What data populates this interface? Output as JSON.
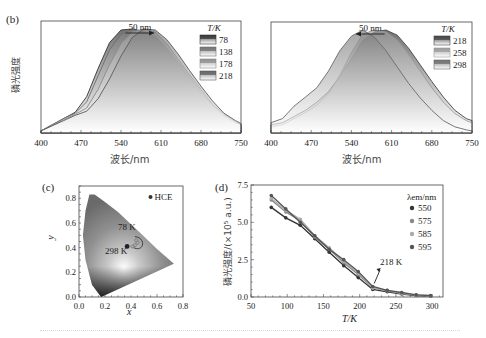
{
  "chart_data": [
    {
      "panel": "(b-left)",
      "type": "area",
      "title": "",
      "xlabel": "波长/nm",
      "ylabel": "磷光强度",
      "xlim": [
        400,
        750
      ],
      "xticks": [
        400,
        470,
        540,
        610,
        680,
        750
      ],
      "legend_title": "T/K",
      "legend_position": "upper right",
      "annotation": "50 nm",
      "annotation_direction": "right",
      "x": [
        400,
        420,
        440,
        460,
        480,
        500,
        520,
        540,
        560,
        580,
        600,
        620,
        640,
        660,
        680,
        700,
        720,
        740,
        750
      ],
      "series": [
        {
          "name": "78",
          "color": "#333333",
          "values": [
            0.02,
            0.08,
            0.14,
            0.2,
            0.35,
            0.62,
            0.87,
            0.99,
            1.0,
            0.97,
            0.92,
            0.8,
            0.66,
            0.52,
            0.38,
            0.26,
            0.16,
            0.1,
            0.08
          ]
        },
        {
          "name": "138",
          "color": "#6e6e6e",
          "values": [
            0.02,
            0.08,
            0.14,
            0.19,
            0.3,
            0.55,
            0.8,
            0.95,
            1.0,
            0.98,
            0.93,
            0.82,
            0.68,
            0.54,
            0.4,
            0.27,
            0.17,
            0.1,
            0.08
          ]
        },
        {
          "name": "178",
          "color": "#8a8a8a",
          "values": [
            0.02,
            0.07,
            0.13,
            0.18,
            0.24,
            0.42,
            0.66,
            0.86,
            0.97,
            1.0,
            0.97,
            0.86,
            0.71,
            0.56,
            0.42,
            0.28,
            0.18,
            0.11,
            0.08
          ]
        },
        {
          "name": "218",
          "color": "#5a5a5a",
          "values": [
            0.02,
            0.07,
            0.12,
            0.17,
            0.21,
            0.33,
            0.52,
            0.74,
            0.92,
            1.0,
            0.99,
            0.9,
            0.76,
            0.6,
            0.45,
            0.31,
            0.19,
            0.12,
            0.09
          ]
        }
      ]
    },
    {
      "panel": "(b-right)",
      "type": "area",
      "title": "",
      "xlabel": "波长/nm",
      "ylabel": "",
      "xlim": [
        400,
        750
      ],
      "xticks": [
        400,
        470,
        540,
        610,
        680,
        750
      ],
      "legend_title": "T/K",
      "legend_position": "upper right",
      "annotation": "50 nm",
      "annotation_direction": "left",
      "x": [
        400,
        420,
        440,
        460,
        480,
        500,
        520,
        540,
        560,
        580,
        600,
        620,
        640,
        660,
        680,
        700,
        720,
        740,
        750
      ],
      "series": [
        {
          "name": "218",
          "color": "#444444",
          "values": [
            0.08,
            0.1,
            0.16,
            0.22,
            0.3,
            0.4,
            0.55,
            0.72,
            0.9,
            0.98,
            1.0,
            0.95,
            0.82,
            0.66,
            0.5,
            0.35,
            0.22,
            0.14,
            0.12
          ]
        },
        {
          "name": "258",
          "color": "#9a9a9a",
          "values": [
            0.06,
            0.08,
            0.14,
            0.2,
            0.27,
            0.38,
            0.56,
            0.78,
            0.96,
            1.0,
            0.98,
            0.9,
            0.76,
            0.6,
            0.44,
            0.3,
            0.19,
            0.12,
            0.1
          ]
        },
        {
          "name": "298",
          "color": "#6a6a6a",
          "values": [
            0.1,
            0.14,
            0.26,
            0.35,
            0.44,
            0.6,
            0.8,
            0.94,
            1.0,
            0.93,
            0.8,
            0.64,
            0.48,
            0.34,
            0.22,
            0.12,
            0.06,
            0.03,
            0.02
          ]
        }
      ]
    },
    {
      "panel": "(c)",
      "type": "scatter",
      "title": "CIE chromaticity diagram",
      "xlabel": "x",
      "ylabel": "y",
      "xlim": [
        0.0,
        0.8
      ],
      "ylim": [
        0.0,
        0.9
      ],
      "xticks": [
        0.0,
        0.2,
        0.4,
        0.6,
        0.8
      ],
      "yticks": [
        0.0,
        0.2,
        0.4,
        0.6,
        0.8
      ],
      "legend": [
        "HCE"
      ],
      "annotations": [
        "78 K",
        "298 K"
      ],
      "points": [
        {
          "label": "78 K",
          "x": 0.46,
          "y": 0.5
        },
        {
          "label": "298 K",
          "x": 0.37,
          "y": 0.41
        }
      ]
    },
    {
      "panel": "(d)",
      "type": "line",
      "title": "",
      "xlabel": "T/K",
      "ylabel": "磷光强度/(×10⁵ a.u.)",
      "xlim": [
        50,
        315
      ],
      "ylim": [
        0.0,
        7.5
      ],
      "xticks": [
        50,
        100,
        150,
        200,
        250,
        300
      ],
      "yticks": [
        0.0,
        2.5,
        5.0,
        7.5
      ],
      "legend_title": "λem/nm",
      "legend_position": "upper right",
      "annotation": "218 K",
      "x": [
        78,
        98,
        118,
        138,
        158,
        178,
        198,
        218,
        238,
        258,
        278,
        298
      ],
      "series": [
        {
          "name": "550",
          "color": "#333333",
          "values": [
            6.0,
            5.3,
            4.8,
            3.9,
            3.0,
            2.1,
            1.3,
            0.5,
            0.35,
            0.2,
            0.1,
            0.05
          ]
        },
        {
          "name": "575",
          "color": "#888888",
          "values": [
            6.5,
            5.7,
            5.1,
            4.0,
            3.2,
            2.3,
            1.5,
            0.6,
            0.4,
            0.25,
            0.12,
            0.06
          ]
        },
        {
          "name": "585",
          "color": "#aaaaaa",
          "values": [
            6.6,
            5.8,
            5.2,
            4.1,
            3.3,
            2.4,
            1.6,
            0.6,
            0.45,
            0.25,
            0.15,
            0.08
          ]
        },
        {
          "name": "595",
          "color": "#555555",
          "values": [
            6.8,
            5.9,
            5.0,
            4.1,
            3.2,
            2.5,
            1.7,
            0.7,
            0.45,
            0.3,
            0.15,
            0.1
          ]
        }
      ]
    }
  ],
  "labels": {
    "panel_b": "(b)",
    "panel_c": "(c)",
    "panel_d": "(d)",
    "b_ylabel": "磷光强度",
    "b_xlabel": "波长/nm",
    "b_shift": "50 nm",
    "legend_title_T": "T/K",
    "c_xlabel": "x",
    "c_ylabel": "y",
    "c_legend": "HCE",
    "c_hot": "78 K",
    "c_cold": "298 K",
    "d_ylabel": "磷光强度/(×10⁵ a.u.)",
    "d_xlabel": "T/K",
    "d_legend_title": "λem/nm",
    "d_annotation": "218 K"
  }
}
